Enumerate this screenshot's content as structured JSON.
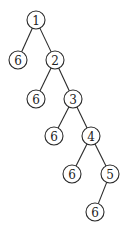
{
  "diagram": {
    "type": "tree",
    "node_radius": 9,
    "nodes": [
      {
        "id": "n1",
        "label": "1",
        "x": 36,
        "y": 20
      },
      {
        "id": "n6a",
        "label": "6",
        "x": 18,
        "y": 60
      },
      {
        "id": "n2",
        "label": "2",
        "x": 55,
        "y": 60
      },
      {
        "id": "n6b",
        "label": "6",
        "x": 36,
        "y": 99
      },
      {
        "id": "n3",
        "label": "3",
        "x": 73,
        "y": 99
      },
      {
        "id": "n6c",
        "label": "6",
        "x": 54,
        "y": 136
      },
      {
        "id": "n4",
        "label": "4",
        "x": 91,
        "y": 136
      },
      {
        "id": "n6d",
        "label": "6",
        "x": 72,
        "y": 174
      },
      {
        "id": "n5",
        "label": "5",
        "x": 110,
        "y": 174
      },
      {
        "id": "n6e",
        "label": "6",
        "x": 95,
        "y": 212
      }
    ],
    "edges": [
      [
        "n1",
        "n6a"
      ],
      [
        "n1",
        "n2"
      ],
      [
        "n2",
        "n6b"
      ],
      [
        "n2",
        "n3"
      ],
      [
        "n3",
        "n6c"
      ],
      [
        "n3",
        "n4"
      ],
      [
        "n4",
        "n6d"
      ],
      [
        "n4",
        "n5"
      ],
      [
        "n5",
        "n6e"
      ]
    ]
  }
}
